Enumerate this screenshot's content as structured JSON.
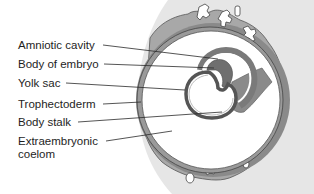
{
  "figure": {
    "type": "anatomical-diagram",
    "colors": {
      "background_blob": "#e6e6e6",
      "trophoblast": "#a8a8a8",
      "trophoblast_dark": "#7f7f7f",
      "villi": "#ffffff",
      "cavity": "#ffffff",
      "outline": "#333333",
      "label_line": "#2a2a2a",
      "text": "#1e1e1e"
    }
  },
  "labels": [
    {
      "id": "amniotic-cavity",
      "text": "Amniotic cavity",
      "y": 39,
      "line": {
        "x1": 103,
        "y1": 45,
        "x2": 218,
        "y2": 59
      }
    },
    {
      "id": "body-of-embryo",
      "text": "Body of embryo",
      "y": 58,
      "line": {
        "x1": 104,
        "y1": 64,
        "x2": 214,
        "y2": 68
      }
    },
    {
      "id": "yolk-sac",
      "text": "Yolk sac",
      "y": 77,
      "line": {
        "x1": 66,
        "y1": 83,
        "x2": 185,
        "y2": 90
      }
    },
    {
      "id": "trophectoderm",
      "text": "Trophectoderm",
      "y": 98,
      "line": {
        "x1": 103,
        "y1": 104,
        "x2": 141,
        "y2": 102
      }
    },
    {
      "id": "body-stalk",
      "text": "Body stalk",
      "y": 116,
      "line": {
        "x1": 78,
        "y1": 122,
        "x2": 220,
        "y2": 112
      }
    },
    {
      "id": "extraembryonic-coelom",
      "text": "Extraembryonic coelom",
      "y": 136,
      "line": {
        "x1": 106,
        "y1": 141,
        "x2": 172,
        "y2": 131
      }
    }
  ]
}
